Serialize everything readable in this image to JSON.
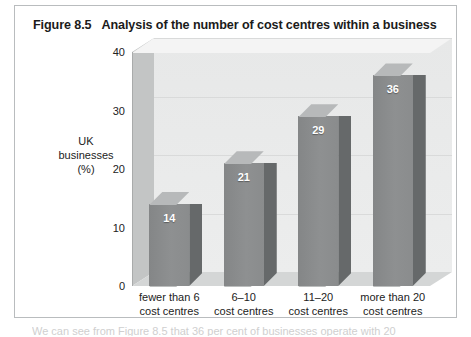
{
  "figure": {
    "number": "Figure 8.5",
    "title": "Analysis of the number of cost centres within a business",
    "border_color": "#b9bcbe"
  },
  "colors": {
    "bar_front": "#8a8c8d",
    "bar_top": "#b7b9ba",
    "bar_side": "#66696a",
    "back_wall": "#ebecec",
    "left_wall": "#c3c5c5",
    "floor": "#d4d6d6",
    "gridline": "#d9dada",
    "value_label": "#ffffff",
    "text": "#222222"
  },
  "body_text": "We can see from Figure 8.5 that 36 per cent of businesses operate with 20",
  "chart_data": {
    "type": "bar",
    "title": "Analysis of the number of cost centres within a business",
    "subtitle": "",
    "xlabel": "",
    "ylabel": "UK businesses (%)",
    "ylabel_lines": [
      "UK",
      "businesses",
      "(%)"
    ],
    "categories": [
      "fewer than 6 cost centres",
      "6–10 cost centres",
      "11–20 cost centres",
      "more than 20 cost centres"
    ],
    "category_lines": [
      [
        "fewer than 6",
        "cost centres"
      ],
      [
        "6–10",
        "cost centres"
      ],
      [
        "11–20",
        "cost centres"
      ],
      [
        "more than 20",
        "cost centres"
      ]
    ],
    "values": [
      14,
      21,
      29,
      36
    ],
    "data_labels": [
      "14",
      "21",
      "29",
      "36"
    ],
    "ylim": [
      0,
      40
    ],
    "yticks": [
      0,
      10,
      20,
      30,
      40
    ],
    "ytick_labels": [
      "0",
      "10",
      "20",
      "30",
      "40"
    ],
    "grid": true,
    "grid_axis": "y",
    "legend": false,
    "legend_position": "none",
    "three_d": true
  }
}
